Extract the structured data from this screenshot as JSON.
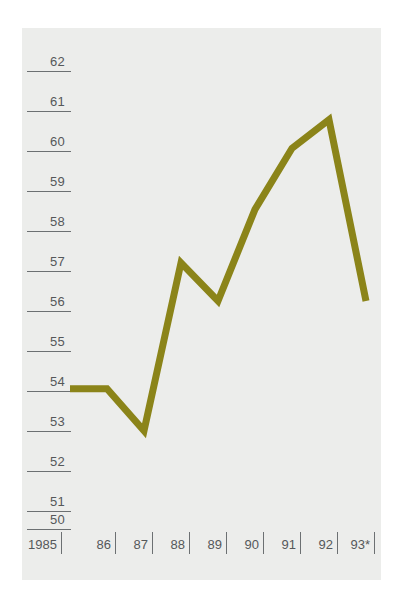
{
  "chart_data": {
    "type": "line",
    "title": "",
    "subtitle": "",
    "xlabel": "",
    "ylabel": "",
    "categories": [
      "1985",
      "86",
      "87",
      "88",
      "89",
      "90",
      "91",
      "92",
      "93*"
    ],
    "x_tick_labels": [
      "1985",
      "86",
      "87",
      "88",
      "89",
      "90",
      "91",
      "92",
      "93*"
    ],
    "y_tick_labels": [
      "62",
      "61",
      "60",
      "59",
      "58",
      "57",
      "56",
      "55",
      "54",
      "53",
      "52",
      "51",
      "50"
    ],
    "ylim": [
      50,
      62
    ],
    "xlim": [
      "1985",
      "93*"
    ],
    "grid": false,
    "legend": null,
    "footnote": "*",
    "series": [
      {
        "name": "series-1",
        "color": "#8b8419",
        "values": [
          53.7,
          53.7,
          52.6,
          57.0,
          56.0,
          58.4,
          60.0,
          60.75,
          56.0
        ]
      }
    ],
    "points": [
      {
        "x": "1985",
        "y": 53.7
      },
      {
        "x": "86",
        "y": 53.7
      },
      {
        "x": "87",
        "y": 52.6
      },
      {
        "x": "88",
        "y": 57.0
      },
      {
        "x": "89",
        "y": 56.0
      },
      {
        "x": "90",
        "y": 58.4
      },
      {
        "x": "91",
        "y": 60.0
      },
      {
        "x": "92",
        "y": 60.75
      },
      {
        "x": "93*",
        "y": 56.0
      }
    ]
  },
  "style": {
    "line_color": "#8b8419",
    "axis_color": "#6c7072",
    "label_color": "#55585a",
    "plot_background": "#ecedeb",
    "page_background": "#ffffff"
  }
}
